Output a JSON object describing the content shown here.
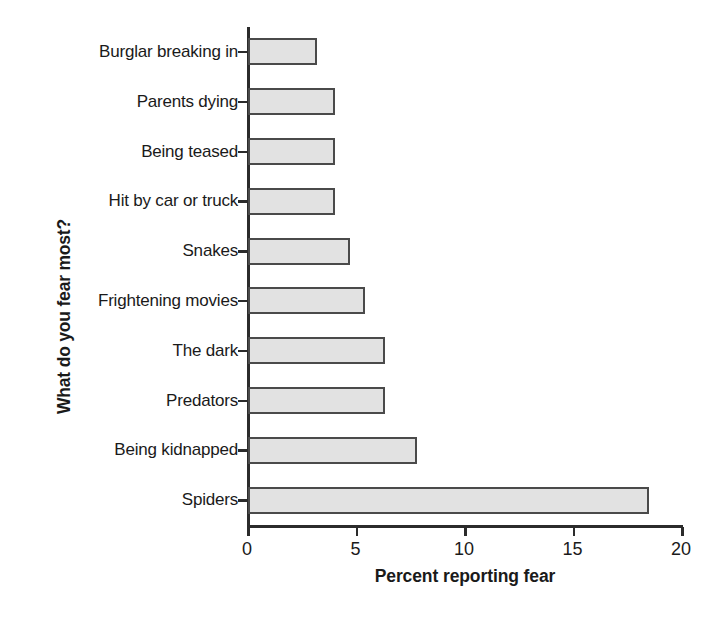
{
  "chart_data": {
    "type": "bar",
    "orientation": "horizontal",
    "title": "",
    "xlabel": "Percent reporting fear",
    "ylabel": "What do you fear most?",
    "categories": [
      "Burglar breaking in",
      "Parents dying",
      "Being teased",
      "Hit by car or truck",
      "Snakes",
      "Frightening movies",
      "The dark",
      "Predators",
      "Being kidnapped",
      "Spiders"
    ],
    "values": [
      3.2,
      4.0,
      4.0,
      4.0,
      4.7,
      5.4,
      6.3,
      6.3,
      7.8,
      18.5
    ],
    "xlim": [
      0,
      20
    ],
    "xticks": [
      0,
      5,
      10,
      15,
      20
    ],
    "xtick_labels": [
      "0",
      "5",
      "10",
      "15",
      "20"
    ],
    "grid": false,
    "legend": false,
    "bar_fill_color": "#e2e2e2",
    "bar_edge_color": "#4a4a4a",
    "axis_color": "#2b2b2b",
    "background_color": "#ffffff"
  }
}
